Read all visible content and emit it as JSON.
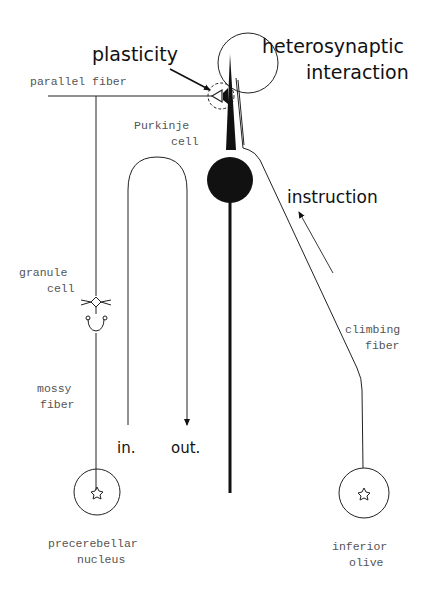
{
  "diagram": {
    "labels": {
      "plasticity": "plasticity",
      "heterosynaptic_line1": "heterosynaptic",
      "heterosynaptic_line2": "interaction",
      "parallel_fiber": "parallel fiber",
      "purkinje_line1": "Purkinje",
      "purkinje_line2": "cell",
      "instruction": "instruction",
      "granule_line1": "granule",
      "granule_line2": "cell",
      "climbing_line1": "climbing",
      "climbing_line2": "fiber",
      "mossy_line1": "mossy",
      "mossy_line2": "fiber",
      "input": "in.",
      "output": "out.",
      "precerebellar_line1": "precerebellar",
      "precerebellar_line2": "nucleus",
      "olive_line1": "inferior",
      "olive_line2": "olive"
    },
    "nodes": [
      {
        "id": "precerebellar-nucleus",
        "type": "source-neuron"
      },
      {
        "id": "granule-cell",
        "type": "interneuron"
      },
      {
        "id": "purkinje-cell",
        "type": "output-neuron"
      },
      {
        "id": "inferior-olive",
        "type": "source-neuron"
      }
    ],
    "edges": [
      {
        "from": "precerebellar-nucleus",
        "to": "granule-cell",
        "label": "mossy fiber"
      },
      {
        "from": "granule-cell",
        "to": "purkinje-cell",
        "label": "parallel fiber"
      },
      {
        "from": "inferior-olive",
        "to": "purkinje-cell",
        "label": "climbing fiber"
      },
      {
        "from": "input",
        "to": "output",
        "label": "in. → out."
      }
    ],
    "colors": {
      "ink": "#111111",
      "label_gray": "#555555",
      "background": "#ffffff"
    }
  }
}
